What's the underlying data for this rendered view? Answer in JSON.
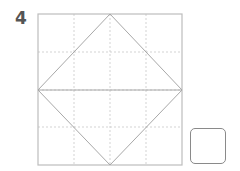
{
  "problem": {
    "number": "4",
    "grid": {
      "rows": 4,
      "cols": 4,
      "outer_color": "#bdbdbd",
      "dash_color": "#c8c8c8",
      "shape_color": "#a8a8a8"
    },
    "shape": "square-rotated-45 with horizontal diagonal",
    "answer_box": {
      "value": ""
    }
  }
}
